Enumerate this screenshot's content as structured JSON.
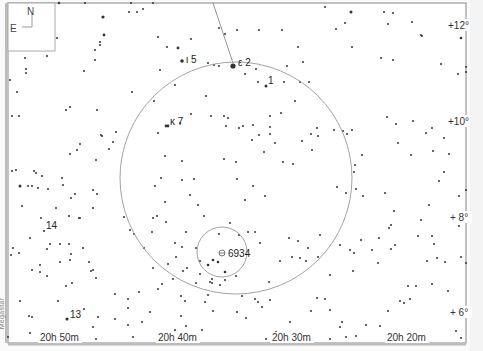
{
  "chart_title": "Finder chart around NGC 6934 (Delphinus)",
  "credit": "Megastar",
  "compass": {
    "north": "N",
    "east": "E"
  },
  "frame": {
    "left": 8,
    "top": 3,
    "right": 466,
    "bottom": 343
  },
  "ra_labels": [
    {
      "text": "20h 50m",
      "x": 40,
      "y": 342
    },
    {
      "text": "20h 40m",
      "x": 158,
      "y": 342
    },
    {
      "text": "20h 30m",
      "x": 272,
      "y": 342
    },
    {
      "text": "20h 20m",
      "x": 387,
      "y": 342
    }
  ],
  "dec_labels": [
    {
      "text": "+12°",
      "x": 448,
      "y": 29
    },
    {
      "text": "+10°",
      "x": 448,
      "y": 125
    },
    {
      "text": "+ 8°",
      "x": 450,
      "y": 221
    },
    {
      "text": "+ 6°",
      "x": 450,
      "y": 316
    }
  ],
  "star_labels": [
    {
      "text": "ι 5",
      "x": 186,
      "y": 63
    },
    {
      "text": "ε 2",
      "x": 238,
      "y": 66
    },
    {
      "text": "1",
      "x": 268,
      "y": 84
    },
    {
      "text": "κ 7",
      "x": 170,
      "y": 125
    },
    {
      "text": "14",
      "x": 46,
      "y": 229
    },
    {
      "text": "13",
      "x": 70,
      "y": 318
    }
  ],
  "target": {
    "label": "6934",
    "x": 222,
    "y": 253
  },
  "big_circle": {
    "cx": 236,
    "cy": 178,
    "r": 116
  },
  "small_circle": {
    "cx": 222,
    "cy": 252,
    "r": 25
  },
  "pointer_line": {
    "x1": 213,
    "y1": 3,
    "x2": 233,
    "y2": 63
  },
  "stars": [
    [
      59,
      3,
      1.2
    ],
    [
      85,
      3,
      1
    ],
    [
      131,
      3,
      1
    ],
    [
      153,
      3,
      1
    ],
    [
      103,
      17,
      1.6
    ],
    [
      137,
      12,
      1
    ],
    [
      143,
      9,
      1
    ],
    [
      129,
      12,
      1
    ],
    [
      104,
      35,
      1.4
    ],
    [
      100,
      42,
      1
    ],
    [
      100,
      45,
      1
    ],
    [
      95,
      50,
      1
    ],
    [
      95,
      60,
      1
    ],
    [
      84,
      71,
      1
    ],
    [
      57,
      38,
      1
    ],
    [
      25,
      58,
      1
    ],
    [
      26,
      69,
      1
    ],
    [
      26,
      73,
      1
    ],
    [
      10,
      80,
      1
    ],
    [
      17,
      92,
      1
    ],
    [
      47,
      56,
      1
    ],
    [
      132,
      92,
      1
    ],
    [
      97,
      110,
      1
    ],
    [
      70,
      107,
      1
    ],
    [
      66,
      110,
      1
    ],
    [
      12,
      116,
      1
    ],
    [
      19,
      116,
      1
    ],
    [
      158,
      37,
      1
    ],
    [
      191,
      39,
      1
    ],
    [
      219,
      28,
      1
    ],
    [
      225,
      34,
      1
    ],
    [
      237,
      30,
      1
    ],
    [
      259,
      30,
      1
    ],
    [
      282,
      30,
      1
    ],
    [
      298,
      47,
      1
    ],
    [
      303,
      62,
      1
    ],
    [
      287,
      66,
      1
    ],
    [
      309,
      82,
      1
    ],
    [
      325,
      7,
      1
    ],
    [
      351,
      12,
      1.5
    ],
    [
      384,
      12,
      1
    ],
    [
      393,
      13,
      1
    ],
    [
      345,
      23,
      1
    ],
    [
      388,
      24,
      1
    ],
    [
      412,
      22,
      1
    ],
    [
      422,
      36,
      1
    ],
    [
      421,
      35,
      1
    ],
    [
      461,
      38,
      1.3
    ],
    [
      336,
      29,
      1
    ],
    [
      352,
      47,
      1
    ],
    [
      381,
      58,
      1
    ],
    [
      393,
      60,
      1
    ],
    [
      441,
      64,
      1
    ],
    [
      458,
      74,
      1
    ],
    [
      466,
      72,
      1
    ],
    [
      466,
      67,
      1
    ],
    [
      167,
      47,
      1
    ],
    [
      178,
      48,
      1.4
    ],
    [
      182,
      61,
      1.8
    ],
    [
      160,
      70,
      1
    ],
    [
      175,
      85,
      1
    ],
    [
      154,
      101,
      1
    ],
    [
      208,
      63,
      1
    ],
    [
      214,
      65,
      1
    ],
    [
      219,
      66,
      1
    ],
    [
      233,
      66,
      2.6
    ],
    [
      245,
      74,
      1
    ],
    [
      256,
      69,
      1
    ],
    [
      258,
      82,
      1
    ],
    [
      266,
      86,
      1.5
    ],
    [
      284,
      82,
      1
    ],
    [
      300,
      82,
      1
    ],
    [
      206,
      96,
      1
    ],
    [
      191,
      114,
      1
    ],
    [
      211,
      116,
      1
    ],
    [
      224,
      116,
      1
    ],
    [
      228,
      118,
      1
    ],
    [
      270,
      116,
      1
    ],
    [
      281,
      113,
      1
    ],
    [
      295,
      101,
      1
    ],
    [
      166,
      126,
      1.4
    ],
    [
      168,
      126,
      1.4
    ],
    [
      180,
      123,
      1
    ],
    [
      226,
      126,
      1
    ],
    [
      239,
      128,
      1
    ],
    [
      243,
      126,
      1
    ],
    [
      158,
      133,
      1
    ],
    [
      253,
      125,
      1
    ],
    [
      259,
      135,
      1
    ],
    [
      270,
      134,
      1
    ],
    [
      270,
      127,
      1
    ],
    [
      311,
      134,
      1
    ],
    [
      317,
      128,
      1
    ],
    [
      318,
      136,
      1
    ],
    [
      252,
      140,
      1
    ],
    [
      275,
      143,
      1
    ],
    [
      302,
      141,
      1
    ],
    [
      312,
      150,
      1
    ],
    [
      264,
      152,
      1
    ],
    [
      283,
      162,
      1
    ],
    [
      293,
      164,
      1
    ],
    [
      236,
      162,
      1
    ],
    [
      224,
      159,
      1
    ],
    [
      237,
      179,
      1
    ],
    [
      253,
      186,
      1
    ],
    [
      265,
      196,
      1
    ],
    [
      245,
      200,
      1
    ],
    [
      204,
      216,
      1
    ],
    [
      198,
      205,
      1
    ],
    [
      190,
      195,
      1
    ],
    [
      182,
      180,
      1
    ],
    [
      194,
      179,
      1
    ],
    [
      182,
      161,
      1
    ],
    [
      165,
      156,
      1
    ],
    [
      161,
      178,
      1
    ],
    [
      155,
      186,
      1
    ],
    [
      165,
      202,
      1
    ],
    [
      157,
      216,
      1
    ],
    [
      153,
      218,
      1
    ],
    [
      343,
      131,
      1
    ],
    [
      334,
      130,
      1
    ],
    [
      347,
      134,
      1
    ],
    [
      352,
      130,
      1
    ],
    [
      387,
      117,
      1
    ],
    [
      413,
      121,
      1
    ],
    [
      396,
      124,
      1
    ],
    [
      398,
      143,
      1
    ],
    [
      432,
      128,
      1
    ],
    [
      426,
      133,
      1
    ],
    [
      444,
      138,
      1
    ],
    [
      433,
      151,
      1
    ],
    [
      449,
      154,
      1
    ],
    [
      411,
      155,
      1
    ],
    [
      362,
      155,
      1
    ],
    [
      355,
      165,
      1
    ],
    [
      354,
      172,
      1
    ],
    [
      337,
      187,
      1
    ],
    [
      356,
      189,
      1
    ],
    [
      346,
      193,
      1
    ],
    [
      363,
      196,
      1
    ],
    [
      394,
      211,
      1
    ],
    [
      389,
      228,
      1
    ],
    [
      429,
      205,
      1
    ],
    [
      449,
      220,
      1
    ],
    [
      385,
      193,
      1
    ],
    [
      361,
      240,
      1
    ],
    [
      379,
      238,
      1
    ],
    [
      391,
      225,
      1
    ],
    [
      421,
      220,
      1
    ],
    [
      12,
      171,
      1
    ],
    [
      16,
      170,
      1
    ],
    [
      28,
      186,
      1
    ],
    [
      32,
      186,
      1
    ],
    [
      34,
      171,
      1
    ],
    [
      42,
      176,
      1
    ],
    [
      20,
      186,
      1
    ],
    [
      36,
      173,
      1
    ],
    [
      38,
      188,
      1
    ],
    [
      62,
      178,
      1
    ],
    [
      63,
      185,
      1
    ],
    [
      70,
      154,
      1
    ],
    [
      102,
      136,
      1
    ],
    [
      113,
      142,
      1
    ],
    [
      116,
      132,
      1
    ],
    [
      109,
      149,
      1
    ],
    [
      101,
      135,
      1
    ],
    [
      80,
      144,
      1
    ],
    [
      96,
      160,
      1
    ],
    [
      77,
      150,
      1
    ],
    [
      20,
      186,
      1.5
    ],
    [
      48,
      189,
      1
    ],
    [
      56,
      208,
      1
    ],
    [
      75,
      194,
      1
    ],
    [
      93,
      190,
      1
    ],
    [
      97,
      194,
      1
    ],
    [
      79,
      218,
      1
    ],
    [
      69,
      216,
      1
    ],
    [
      41,
      218,
      1
    ],
    [
      80,
      218,
      1
    ],
    [
      71,
      198,
      1
    ],
    [
      93,
      208,
      1
    ],
    [
      44,
      231,
      1
    ],
    [
      50,
      244,
      1
    ],
    [
      60,
      244,
      1
    ],
    [
      69,
      244,
      1
    ],
    [
      19,
      253,
      1
    ],
    [
      47,
      249,
      1
    ],
    [
      71,
      254,
      1
    ],
    [
      83,
      248,
      1
    ],
    [
      89,
      262,
      1
    ],
    [
      93,
      270,
      1
    ],
    [
      91,
      271,
      1
    ],
    [
      40,
      272,
      1
    ],
    [
      47,
      276,
      1
    ],
    [
      96,
      278,
      1
    ],
    [
      70,
      260,
      1
    ],
    [
      60,
      262,
      1
    ],
    [
      66,
      286,
      1
    ],
    [
      72,
      283,
      1
    ],
    [
      11,
      255,
      1
    ],
    [
      32,
      270,
      1
    ],
    [
      40,
      265,
      1
    ],
    [
      20,
      301,
      1
    ],
    [
      29,
      316,
      1
    ],
    [
      58,
      301,
      1
    ],
    [
      67,
      319,
      1.6
    ],
    [
      84,
      309,
      1
    ],
    [
      98,
      317,
      1
    ],
    [
      93,
      327,
      1
    ],
    [
      115,
      319,
      1
    ],
    [
      128,
      308,
      1
    ],
    [
      128,
      325,
      1
    ],
    [
      128,
      299,
      1
    ],
    [
      115,
      294,
      1
    ],
    [
      139,
      292,
      1
    ],
    [
      153,
      268,
      1
    ],
    [
      144,
      248,
      1
    ],
    [
      175,
      243,
      1
    ],
    [
      152,
      232,
      1
    ],
    [
      166,
      222,
      1
    ],
    [
      162,
      284,
      1
    ],
    [
      181,
      296,
      1
    ],
    [
      185,
      301,
      1
    ],
    [
      181,
      316,
      1
    ],
    [
      202,
      330,
      1
    ],
    [
      213,
      311,
      1
    ],
    [
      208,
      295,
      1
    ],
    [
      200,
      274,
      1
    ],
    [
      212,
      283,
      1
    ],
    [
      212,
      279,
      1
    ],
    [
      210,
      282,
      1
    ],
    [
      200,
      261,
      1
    ],
    [
      218,
      262,
      1
    ],
    [
      225,
      280,
      1
    ],
    [
      236,
      276,
      1
    ],
    [
      242,
      296,
      1
    ],
    [
      255,
      299,
      1
    ],
    [
      237,
      312,
      1
    ],
    [
      258,
      302,
      1
    ],
    [
      246,
      318,
      1
    ],
    [
      269,
      282,
      1
    ],
    [
      280,
      261,
      1
    ],
    [
      292,
      257,
      1
    ],
    [
      300,
      258,
      1
    ],
    [
      306,
      261,
      1
    ],
    [
      317,
      298,
      1
    ],
    [
      325,
      299,
      1
    ],
    [
      330,
      310,
      1
    ],
    [
      342,
      322,
      1
    ],
    [
      340,
      327,
      1
    ],
    [
      356,
      336,
      1
    ],
    [
      346,
      337,
      1
    ],
    [
      366,
      325,
      1
    ],
    [
      380,
      326,
      1
    ],
    [
      388,
      311,
      1
    ],
    [
      400,
      301,
      1
    ],
    [
      404,
      303,
      1
    ],
    [
      410,
      299,
      1
    ],
    [
      408,
      286,
      1
    ],
    [
      416,
      286,
      1
    ],
    [
      432,
      284,
      1
    ],
    [
      448,
      291,
      1
    ],
    [
      452,
      310,
      1
    ],
    [
      456,
      331,
      1
    ],
    [
      461,
      338,
      1
    ],
    [
      419,
      334,
      1
    ],
    [
      418,
      236,
      1
    ],
    [
      432,
      236,
      1
    ],
    [
      434,
      244,
      1
    ],
    [
      427,
      261,
      1
    ],
    [
      437,
      258,
      1
    ],
    [
      445,
      262,
      1
    ],
    [
      391,
      249,
      1
    ],
    [
      395,
      245,
      1
    ],
    [
      378,
      263,
      1
    ],
    [
      372,
      250,
      1
    ],
    [
      340,
      245,
      1
    ],
    [
      350,
      250,
      1
    ],
    [
      354,
      253,
      1
    ],
    [
      320,
      235,
      1
    ],
    [
      318,
      257,
      1
    ],
    [
      330,
      275,
      1
    ],
    [
      353,
      271,
      1
    ],
    [
      308,
      248,
      1
    ],
    [
      298,
      241,
      1
    ],
    [
      289,
      238,
      1
    ],
    [
      311,
      311,
      1
    ],
    [
      290,
      322,
      1
    ],
    [
      276,
      332,
      1
    ],
    [
      266,
      339,
      1
    ],
    [
      330,
      339,
      1
    ],
    [
      270,
      300,
      1
    ],
    [
      262,
      307,
      1
    ],
    [
      255,
      232,
      1
    ],
    [
      260,
      243,
      1
    ],
    [
      248,
      232,
      1
    ],
    [
      239,
      235,
      1
    ],
    [
      230,
      223,
      1
    ],
    [
      219,
      234,
      1
    ],
    [
      213,
      260,
      1.3
    ],
    [
      218,
      262,
      1.3
    ],
    [
      208,
      265,
      1.3
    ],
    [
      225,
      272,
      1.3
    ],
    [
      196,
      248,
      1
    ],
    [
      186,
      232,
      1
    ],
    [
      182,
      247,
      1
    ],
    [
      176,
      257,
      1
    ],
    [
      187,
      268,
      1
    ],
    [
      183,
      271,
      1
    ],
    [
      196,
      283,
      1
    ],
    [
      168,
      264,
      1
    ],
    [
      173,
      279,
      1
    ],
    [
      158,
      289,
      1
    ],
    [
      220,
      285,
      1
    ],
    [
      205,
      302,
      1
    ],
    [
      186,
      326,
      1
    ],
    [
      175,
      330,
      1
    ],
    [
      150,
      312,
      1
    ],
    [
      142,
      322,
      1
    ],
    [
      133,
      337,
      1
    ],
    [
      55,
      339,
      1
    ],
    [
      8,
      337,
      1
    ],
    [
      30,
      333,
      1
    ],
    [
      32,
      317,
      1
    ],
    [
      96,
      339,
      1
    ],
    [
      452,
      215,
      1
    ],
    [
      459,
      226,
      1
    ],
    [
      463,
      215,
      1
    ],
    [
      459,
      196,
      1
    ],
    [
      466,
      190,
      1
    ],
    [
      444,
      172,
      1
    ],
    [
      439,
      181,
      1
    ],
    [
      461,
      257,
      1
    ],
    [
      466,
      263,
      1
    ],
    [
      22,
      206,
      1
    ],
    [
      30,
      238,
      1
    ],
    [
      13,
      248,
      1
    ],
    [
      124,
      217,
      1
    ],
    [
      130,
      230,
      1
    ],
    [
      134,
      234,
      1
    ]
  ]
}
